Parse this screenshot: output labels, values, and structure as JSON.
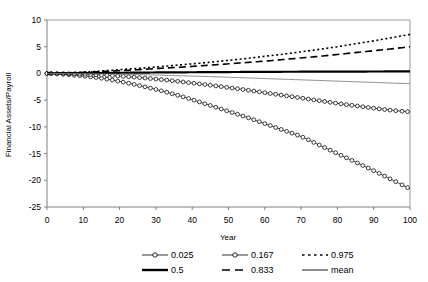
{
  "chart_data": {
    "type": "line",
    "title": "",
    "xlabel": "Year",
    "ylabel": "Financial Assets/Payroll",
    "xlim": [
      0,
      100
    ],
    "ylim": [
      -25,
      10
    ],
    "xticks": [
      0,
      10,
      20,
      30,
      40,
      50,
      60,
      70,
      80,
      90,
      100
    ],
    "yticks": [
      10,
      5,
      0,
      -5,
      -10,
      -15,
      -20,
      -25
    ],
    "grid": false,
    "legend_position": "bottom",
    "x": [
      0,
      5,
      10,
      15,
      20,
      25,
      30,
      35,
      40,
      45,
      50,
      55,
      60,
      65,
      70,
      75,
      80,
      85,
      90,
      95,
      100
    ],
    "series": [
      {
        "name": "0.025",
        "label": "0.025",
        "style": "line-marker-circle",
        "color": "#000000",
        "values": [
          0.0,
          -0.2,
          -0.5,
          -0.9,
          -1.5,
          -2.2,
          -3.0,
          -3.9,
          -4.9,
          -6.0,
          -7.1,
          -8.2,
          -9.4,
          -10.6,
          -11.8,
          -13.4,
          -15.0,
          -16.6,
          -18.2,
          -19.9,
          -21.6
        ]
      },
      {
        "name": "0.167",
        "label": "0.167",
        "style": "line-marker-circle",
        "color": "#000000",
        "values": [
          0.0,
          -0.05,
          -0.15,
          -0.3,
          -0.5,
          -0.75,
          -1.05,
          -1.4,
          -1.8,
          -2.2,
          -2.65,
          -3.1,
          -3.6,
          -4.1,
          -4.6,
          -5.1,
          -5.6,
          -6.05,
          -6.5,
          -6.9,
          -7.2
        ]
      },
      {
        "name": "0.975",
        "label": "0.975",
        "style": "dotted",
        "color": "#000000",
        "values": [
          0.0,
          0.1,
          0.25,
          0.45,
          0.7,
          0.95,
          1.2,
          1.5,
          1.8,
          2.1,
          2.45,
          2.8,
          3.2,
          3.6,
          4.05,
          4.5,
          5.0,
          5.55,
          6.1,
          6.7,
          7.3
        ]
      },
      {
        "name": "0.5",
        "label": "0.5",
        "style": "solid-thick",
        "color": "#000000",
        "values": [
          0.0,
          0.02,
          0.05,
          0.08,
          0.12,
          0.15,
          0.18,
          0.2,
          0.22,
          0.24,
          0.26,
          0.28,
          0.3,
          0.31,
          0.32,
          0.33,
          0.34,
          0.35,
          0.36,
          0.37,
          0.38
        ]
      },
      {
        "name": "0.833",
        "label": "0.833",
        "style": "dashed",
        "color": "#000000",
        "values": [
          0.0,
          0.08,
          0.2,
          0.35,
          0.52,
          0.7,
          0.9,
          1.1,
          1.32,
          1.55,
          1.8,
          2.05,
          2.3,
          2.6,
          2.9,
          3.2,
          3.55,
          3.9,
          4.25,
          4.6,
          5.0
        ]
      },
      {
        "name": "mean",
        "label": "mean",
        "style": "solid-thin",
        "color": "#7f7f7f",
        "values": [
          0.0,
          -0.02,
          -0.05,
          -0.1,
          -0.15,
          -0.22,
          -0.3,
          -0.4,
          -0.5,
          -0.6,
          -0.72,
          -0.84,
          -0.96,
          -1.08,
          -1.2,
          -1.32,
          -1.44,
          -1.56,
          -1.68,
          -1.8,
          -1.92
        ]
      }
    ]
  },
  "legend": {
    "rows": [
      [
        {
          "label": "0.025",
          "style": "line-marker-circle"
        },
        {
          "label": "0.167",
          "style": "line-marker-circle"
        },
        {
          "label": "0.975",
          "style": "dotted"
        }
      ],
      [
        {
          "label": "0.5",
          "style": "solid-thick"
        },
        {
          "label": "0.833",
          "style": "dashed"
        },
        {
          "label": "mean",
          "style": "solid-thin"
        }
      ]
    ]
  }
}
